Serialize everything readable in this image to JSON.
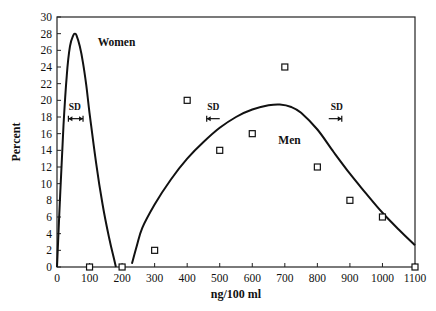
{
  "chart_data": {
    "type": "line",
    "title": "",
    "xlabel": "ng/100 ml",
    "ylabel": "Percent",
    "xlim": [
      0,
      1100
    ],
    "ylim": [
      0,
      30
    ],
    "grid": false,
    "legend": "none",
    "x_ticks": [
      0,
      100,
      200,
      300,
      400,
      500,
      600,
      700,
      800,
      900,
      1000,
      1100
    ],
    "x_tick_labels": [
      "0",
      "100",
      "200",
      "300",
      "400",
      "500",
      "600",
      "700",
      "800",
      "900",
      "1000",
      "1100"
    ],
    "y_ticks": [
      0,
      2,
      4,
      6,
      8,
      10,
      12,
      14,
      16,
      18,
      20,
      22,
      24,
      26,
      28,
      30
    ],
    "y_tick_labels": [
      "0",
      "2",
      "4",
      "6",
      "8",
      "10",
      "12",
      "14",
      "16",
      "18",
      "20",
      "22",
      "24",
      "26",
      "28",
      "30"
    ],
    "series": [
      {
        "name": "Women",
        "kind": "curve",
        "x": [
          0,
          10,
          20,
          30,
          40,
          50,
          55,
          60,
          70,
          80,
          90,
          100,
          120,
          140,
          160,
          175,
          181
        ],
        "y": [
          0,
          9,
          17,
          23,
          26.5,
          27.8,
          28,
          27.8,
          26.5,
          24.5,
          21.8,
          18.5,
          12.5,
          7.5,
          3.5,
          1.0,
          0
        ]
      },
      {
        "name": "Men",
        "kind": "curve",
        "x": [
          230,
          245,
          262,
          300,
          350,
          400,
          450,
          500,
          550,
          600,
          650,
          685,
          720,
          750,
          800,
          850,
          900,
          950,
          1000,
          1050,
          1100
        ],
        "y": [
          0.4,
          2.5,
          4.7,
          7.5,
          10.5,
          13.0,
          15.0,
          16.7,
          18.0,
          18.9,
          19.4,
          19.5,
          19.2,
          18.5,
          16.5,
          13.8,
          11.2,
          8.8,
          6.5,
          4.5,
          2.6
        ]
      },
      {
        "name": "Observed",
        "kind": "points",
        "marker": "open-square",
        "x": [
          100,
          200,
          300,
          400,
          500,
          600,
          700,
          800,
          900,
          1000,
          1100
        ],
        "y": [
          0,
          0,
          2,
          20,
          14,
          16,
          24,
          12,
          8,
          6,
          0
        ]
      }
    ],
    "annotations": [
      {
        "text": "Women",
        "x": 125,
        "y": 26.5
      },
      {
        "text": "Men",
        "x": 680,
        "y": 14.8
      },
      {
        "text": "SD",
        "x": 55,
        "y": 18.8,
        "arrow": "double",
        "arrow_x": [
          35,
          80
        ],
        "arrow_y": 17.8
      },
      {
        "text": "SD",
        "x": 480,
        "y": 18.8,
        "arrow": "left",
        "arrow_x": [
          460,
          500
        ],
        "arrow_y": 17.8
      },
      {
        "text": "SD",
        "x": 860,
        "y": 18.8,
        "arrow": "right",
        "arrow_x": [
          835,
          875
        ],
        "arrow_y": 17.8
      }
    ]
  }
}
